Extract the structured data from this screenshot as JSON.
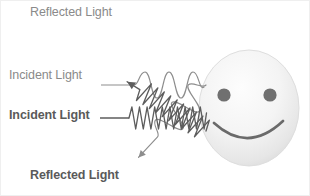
{
  "figure": {
    "background_color": "#ffffff",
    "border_color": "#efefef",
    "width": 310,
    "height": 196
  },
  "labels": {
    "reflected_top": "Reflected Light",
    "incident_top": "Incident Light",
    "incident_bottom": "Incident Light",
    "reflected_bottom": "Reflected Light"
  },
  "colors": {
    "light_text": "#8a8a8a",
    "dark_text": "#5a5a5a",
    "light_wave": "#8d8d8d",
    "dark_wave": "#5d5d5d",
    "face_fill": "#f2f2f2",
    "face_edge": "#d8d8d8",
    "face_feature": "#6a6a6a"
  },
  "waves": {
    "incident_long": {
      "name": "incident-long-wavelength-wave",
      "amplitude": 9,
      "wavelength": 22,
      "cycles": 3,
      "direction": "left-to-right horizontal",
      "baseline_y": 84,
      "start_x": 102,
      "end_x": 205,
      "stroke": "#8d8d8d",
      "stroke_width": 1.1
    },
    "reflected_long": {
      "name": "reflected-long-wavelength-wave",
      "amplitude": 9,
      "wavelength": 22,
      "cycles": 3,
      "direction": "up-and-left diagonal",
      "angle_deg": -45,
      "arrow_tip_x": 130,
      "arrow_tip_y": 12,
      "stroke": "#8d8d8d",
      "stroke_width": 1.1
    },
    "incident_short": {
      "name": "incident-short-wavelength-wave",
      "amplitude": 11,
      "wavelength": 7.5,
      "cycles": 13,
      "direction": "left-to-right horizontal",
      "baseline_y": 117,
      "start_x": 100,
      "end_x": 205,
      "stroke": "#5d5d5d",
      "stroke_width": 1.2
    },
    "reflected_short": {
      "name": "reflected-short-wavelength-wave",
      "amplitude": 11,
      "wavelength": 7.5,
      "cycles": 13,
      "direction": "down-and-left diagonal",
      "angle_deg": 33,
      "arrow_tip_x": 133,
      "arrow_tip_y": 183,
      "stroke": "#5d5d5d",
      "stroke_width": 1.2
    }
  },
  "face": {
    "name": "smiley-face",
    "center_x": 248,
    "center_y": 107,
    "radius_x": 50,
    "radius_y": 58,
    "eyes": [
      {
        "cx": 223,
        "cy": 94,
        "r": 6.5
      },
      {
        "cx": 269,
        "cy": 94,
        "r": 6.5
      }
    ],
    "mouth": {
      "cx": 247,
      "cy": 121,
      "rx": 36,
      "ry": 22
    }
  }
}
